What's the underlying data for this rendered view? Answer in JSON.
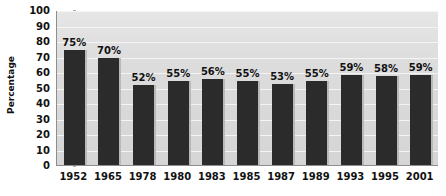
{
  "chart_data": {
    "type": "bar",
    "title": "",
    "xlabel": "",
    "ylabel": "Percentage",
    "ylim": [
      0,
      100
    ],
    "ytick_step": 10,
    "yticks": [
      100,
      90,
      80,
      70,
      60,
      50,
      40,
      30,
      20,
      10,
      0
    ],
    "grid": true,
    "legend": "none",
    "categories": [
      "1952",
      "1965",
      "1978",
      "1980",
      "1983",
      "1985",
      "1987",
      "1989",
      "1993",
      "1995",
      "2001"
    ],
    "values": [
      75,
      70,
      52,
      55,
      56,
      55,
      53,
      55,
      59,
      58,
      59
    ],
    "data_labels": [
      "75%",
      "70%",
      "52%",
      "55%",
      "56%",
      "55%",
      "53%",
      "55%",
      "59%",
      "58%",
      "59%"
    ],
    "colors": {
      "bar": "#2b2b2b",
      "bar_shadow": "#b9b9b9",
      "plot_background": "#d9d9d9",
      "gridline": "#f4f4f4",
      "axis": "#8e8e8e",
      "text": "#111111",
      "page_background": "#ffffff"
    }
  }
}
